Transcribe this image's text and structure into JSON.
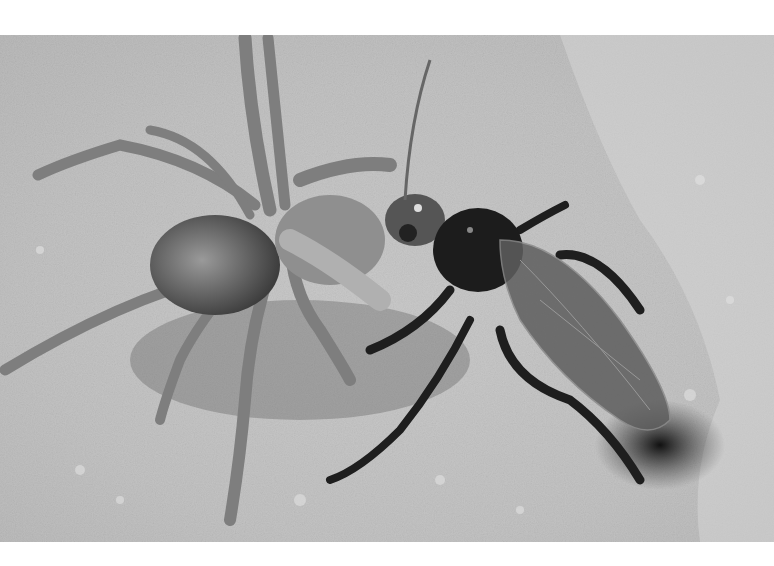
{
  "image": {
    "subject": "spider wasp dragging a wolf spider toward a burrow in sand",
    "style": "black-and-white photograph",
    "frame": {
      "top": 35,
      "bottom": 542,
      "left": 0,
      "right": 774
    },
    "colors": {
      "border": "#ffffff",
      "sand_light": "#d9d9d9",
      "sand_mid": "#b5b5b5",
      "sand_dark": "#6e6e6e",
      "wasp": "#1c1c1c",
      "wing": "#5a5a5a",
      "spider_body": "#7a7a7a",
      "spider_leg": "#8c8c8c",
      "burrow": "#262626"
    }
  }
}
